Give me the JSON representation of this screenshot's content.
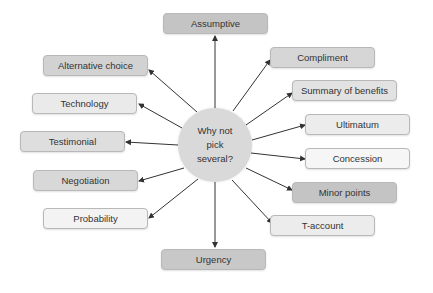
{
  "center": {
    "label": "Why not pick several?"
  },
  "nodes": [
    {
      "label": "Assumptive",
      "x": 163,
      "y": 13,
      "fill": "#c4c4c4"
    },
    {
      "label": "Compliment",
      "x": 270,
      "y": 47,
      "fill": "#d6d6d6"
    },
    {
      "label": "Summary of benefits",
      "x": 292,
      "y": 80,
      "fill": "#e2e2e2"
    },
    {
      "label": "Ultimatum",
      "x": 305,
      "y": 114,
      "fill": "#ececec"
    },
    {
      "label": "Concession",
      "x": 305,
      "y": 148,
      "fill": "#f6f6f6"
    },
    {
      "label": "Minor points",
      "x": 292,
      "y": 182,
      "fill": "#c4c4c4"
    },
    {
      "label": "T-account",
      "x": 270,
      "y": 215,
      "fill": "#ececec"
    },
    {
      "label": "Urgency",
      "x": 161,
      "y": 249,
      "fill": "#c8c8c8"
    },
    {
      "label": "Probability",
      "x": 43,
      "y": 208,
      "fill": "#f3f3f3"
    },
    {
      "label": "Negotiation",
      "x": 33,
      "y": 170,
      "fill": "#d8d8d8"
    },
    {
      "label": "Testimonial",
      "x": 20,
      "y": 131,
      "fill": "#dedede"
    },
    {
      "label": "Technology",
      "x": 32,
      "y": 93,
      "fill": "#eaeaea"
    },
    {
      "label": "Alternative choice",
      "x": 43,
      "y": 55,
      "fill": "#d2d2d2"
    }
  ],
  "arrows": [
    {
      "to": "Assumptive",
      "x1": 215,
      "y1": 108,
      "x2": 215,
      "y2": 36
    },
    {
      "to": "Compliment",
      "x1": 233,
      "y1": 111,
      "x2": 270,
      "y2": 60
    },
    {
      "to": "Summary of benefits",
      "x1": 246,
      "y1": 125,
      "x2": 292,
      "y2": 93
    },
    {
      "to": "Ultimatum",
      "x1": 252,
      "y1": 140,
      "x2": 305,
      "y2": 125
    },
    {
      "to": "Concession",
      "x1": 251,
      "y1": 153,
      "x2": 305,
      "y2": 159
    },
    {
      "to": "Minor points",
      "x1": 246,
      "y1": 168,
      "x2": 292,
      "y2": 190
    },
    {
      "to": "T-account",
      "x1": 232,
      "y1": 180,
      "x2": 272,
      "y2": 223
    },
    {
      "to": "Urgency",
      "x1": 215,
      "y1": 182,
      "x2": 215,
      "y2": 247
    },
    {
      "to": "Probability",
      "x1": 198,
      "y1": 179,
      "x2": 149,
      "y2": 218
    },
    {
      "to": "Negotiation",
      "x1": 184,
      "y1": 168,
      "x2": 139,
      "y2": 181
    },
    {
      "to": "Testimonial",
      "x1": 178,
      "y1": 145,
      "x2": 126,
      "y2": 142
    },
    {
      "to": "Technology",
      "x1": 182,
      "y1": 128,
      "x2": 139,
      "y2": 104
    },
    {
      "to": "Alternative choice",
      "x1": 197,
      "y1": 112,
      "x2": 149,
      "y2": 70
    }
  ],
  "colors": {
    "arrow": "#333333",
    "center_fill": "#d9d9d9",
    "border": "#b8b8b8"
  }
}
